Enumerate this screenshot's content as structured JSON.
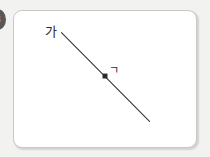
{
  "page": {
    "background_color": "#f2f2f0",
    "badge": {
      "label": "3",
      "color": "#585858",
      "text_color": "#f4f4f4",
      "clipped": "true"
    }
  },
  "figure": {
    "name": "geometry-figure-card",
    "background_color": "#ffffff",
    "border_color": "#c9c9c9",
    "stroke_color": "#3a3a3a",
    "labels": {
      "line_label": "가",
      "point_label": "ㄱ"
    },
    "geometry": {
      "line": {
        "x1": 48,
        "y1": 22,
        "x2": 137,
        "y2": 112
      },
      "point": {
        "x": 92,
        "y": 66,
        "marker": "filled-square"
      }
    }
  }
}
